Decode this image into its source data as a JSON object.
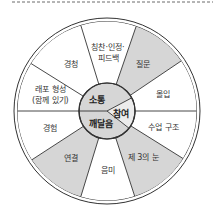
{
  "diagram": {
    "type": "wheel",
    "colors": {
      "gray": "#d6d6d6",
      "white": "#ffffff",
      "light": "#ececec",
      "stroke": "#333333"
    },
    "center": {
      "top": {
        "label": "소통"
      },
      "right": {
        "label": "참여"
      },
      "bottom": {
        "label": "깨달음"
      }
    },
    "segments": [
      {
        "label_lines": [
          "칭찬·인정·",
          "피드백"
        ],
        "shade": "white"
      },
      {
        "label_lines": [
          "질문"
        ],
        "shade": "gray"
      },
      {
        "label_lines": [
          "몰입"
        ],
        "shade": "white"
      },
      {
        "label_lines": [
          "수업 구조"
        ],
        "shade": "white"
      },
      {
        "label_lines": [
          "제 3의 눈"
        ],
        "shade": "gray"
      },
      {
        "label_lines": [
          "음미"
        ],
        "shade": "white"
      },
      {
        "label_lines": [
          "연결"
        ],
        "shade": "gray"
      },
      {
        "label_lines": [
          "경험"
        ],
        "shade": "white"
      },
      {
        "label_lines": [
          "래포 형성",
          "(함께 있기)"
        ],
        "shade": "white"
      },
      {
        "label_lines": [
          "경청"
        ],
        "shade": "white"
      }
    ]
  }
}
